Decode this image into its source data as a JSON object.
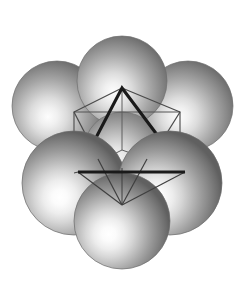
{
  "figure": {
    "title": "Hexagonal close-packed sphere cluster with inscribed octahedral wireframe",
    "canvas": {
      "width": 245,
      "height": 286,
      "background": "#ffffff"
    },
    "palette": {
      "background": "#ffffff",
      "sphere_highlight": "#ffffff",
      "sphere_midtone": "#a8a8a8",
      "sphere_shadow": "#5a5a5a",
      "sphere_rim": "#6e6e6e",
      "bold_line": "#1a1a1a",
      "thin_line": "#4a4a4a"
    },
    "spheres": {
      "count": 7,
      "radius": 45,
      "highlight_offset": {
        "dx": -0.22,
        "dy": 0.26
      },
      "items": [
        {
          "name": "sphere-top",
          "cx": 122,
          "cy": 81,
          "r": 45,
          "layer": "back"
        },
        {
          "name": "sphere-upper-left",
          "cx": 57,
          "cy": 106,
          "r": 45,
          "layer": "back"
        },
        {
          "name": "sphere-upper-right",
          "cx": 188,
          "cy": 106,
          "r": 45,
          "layer": "back"
        },
        {
          "name": "sphere-center-hidden",
          "cx": 122,
          "cy": 150,
          "r": 38,
          "layer": "mid"
        },
        {
          "name": "sphere-lower-left",
          "cx": 74,
          "cy": 183,
          "r": 52,
          "layer": "front"
        },
        {
          "name": "sphere-lower-right",
          "cx": 170,
          "cy": 183,
          "r": 52,
          "layer": "front"
        },
        {
          "name": "sphere-bottom",
          "cx": 122,
          "cy": 221,
          "r": 48,
          "layer": "front"
        }
      ]
    },
    "wireframe": {
      "bold_triangle": {
        "name": "bold-triangle",
        "stroke": "#1a1a1a",
        "stroke_width": 3.1,
        "points": "122,88 78,172 185,172"
      },
      "square": {
        "name": "projected-square",
        "stroke": "#555555",
        "stroke_width": 1.2,
        "points": "74,112 180,112 180,173 74,173"
      },
      "inverted_triangle": {
        "name": "inverted-triangle",
        "stroke": "#4a4a4a",
        "stroke_width": 1.3,
        "points": "74,112 180,112 122,205"
      },
      "edges": [
        {
          "name": "edge-apex-to-left-top",
          "x1": 122,
          "y1": 88,
          "x2": 74,
          "y2": 112
        },
        {
          "name": "edge-apex-to-right-top",
          "x1": 122,
          "y1": 88,
          "x2": 180,
          "y2": 112
        },
        {
          "name": "edge-left-top-to-bottom-vertex",
          "x1": 74,
          "y1": 112,
          "x2": 122,
          "y2": 205
        },
        {
          "name": "edge-right-top-to-bottom-vertex",
          "x1": 180,
          "y1": 112,
          "x2": 122,
          "y2": 205
        },
        {
          "name": "edge-left-base-to-bottom-vertex",
          "x1": 78,
          "y1": 172,
          "x2": 122,
          "y2": 205
        },
        {
          "name": "edge-right-base-to-bottom-vertex",
          "x1": 185,
          "y1": 172,
          "x2": 122,
          "y2": 205
        },
        {
          "name": "edge-left-top-to-left-base",
          "x1": 74,
          "y1": 112,
          "x2": 78,
          "y2": 172
        },
        {
          "name": "edge-right-top-to-right-base",
          "x1": 180,
          "y1": 112,
          "x2": 185,
          "y2": 172
        },
        {
          "name": "edge-apex-to-center",
          "x1": 122,
          "y1": 88,
          "x2": 122,
          "y2": 150
        },
        {
          "name": "edge-center-to-left-base",
          "x1": 122,
          "y1": 150,
          "x2": 78,
          "y2": 172
        },
        {
          "name": "edge-center-to-right-base",
          "x1": 122,
          "y1": 150,
          "x2": 185,
          "y2": 172
        }
      ],
      "vertices": [
        {
          "name": "vertex-apex",
          "x": 122,
          "y": 88
        },
        {
          "name": "vertex-left-top",
          "x": 74,
          "y": 112
        },
        {
          "name": "vertex-right-top",
          "x": 180,
          "y": 112
        },
        {
          "name": "vertex-left-base",
          "x": 78,
          "y": 172
        },
        {
          "name": "vertex-right-base",
          "x": 185,
          "y": 172
        },
        {
          "name": "vertex-bottom",
          "x": 122,
          "y": 205
        },
        {
          "name": "vertex-center",
          "x": 122,
          "y": 150
        }
      ]
    }
  }
}
